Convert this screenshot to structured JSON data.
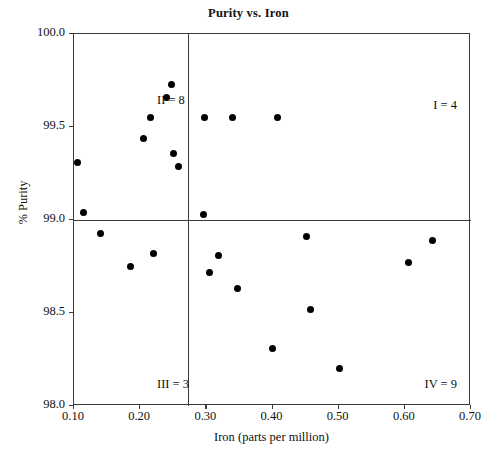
{
  "chart_data": {
    "type": "scatter",
    "title": "Purity vs. Iron",
    "xlabel": "Iron (parts per million)",
    "ylabel": "% Purity",
    "xlim": [
      0.1,
      0.7
    ],
    "ylim": [
      98.0,
      100.0
    ],
    "xticks": [
      "0.10",
      "0.20",
      "0.30",
      "0.40",
      "0.50",
      "0.60",
      "0.70"
    ],
    "xtick_values": [
      0.1,
      0.2,
      0.3,
      0.4,
      0.5,
      0.6,
      0.7
    ],
    "yticks": [
      "100.0",
      "99.5",
      "99.0",
      "98.5",
      "98.0"
    ],
    "ytick_values": [
      100.0,
      99.5,
      99.0,
      98.5,
      98.0
    ],
    "grid": false,
    "legend": null,
    "marker": "filled-circle",
    "marker_color": "#000000",
    "frame_color": "#3a3a3a",
    "divider_x": 0.2725,
    "divider_y": 99.0,
    "points": [
      {
        "x": 0.105,
        "y": 99.31
      },
      {
        "x": 0.115,
        "y": 99.04
      },
      {
        "x": 0.14,
        "y": 98.93
      },
      {
        "x": 0.185,
        "y": 98.75
      },
      {
        "x": 0.205,
        "y": 99.44
      },
      {
        "x": 0.215,
        "y": 99.55
      },
      {
        "x": 0.22,
        "y": 98.82
      },
      {
        "x": 0.24,
        "y": 99.66
      },
      {
        "x": 0.248,
        "y": 99.73
      },
      {
        "x": 0.25,
        "y": 99.36
      },
      {
        "x": 0.258,
        "y": 99.29
      },
      {
        "x": 0.295,
        "y": 99.03
      },
      {
        "x": 0.297,
        "y": 99.55
      },
      {
        "x": 0.305,
        "y": 98.72
      },
      {
        "x": 0.318,
        "y": 98.81
      },
      {
        "x": 0.34,
        "y": 99.55
      },
      {
        "x": 0.347,
        "y": 98.63
      },
      {
        "x": 0.4,
        "y": 98.31
      },
      {
        "x": 0.408,
        "y": 99.55
      },
      {
        "x": 0.452,
        "y": 98.91
      },
      {
        "x": 0.458,
        "y": 98.52
      },
      {
        "x": 0.502,
        "y": 98.2
      },
      {
        "x": 0.605,
        "y": 98.77
      },
      {
        "x": 0.642,
        "y": 98.89
      }
    ],
    "annotations": [
      {
        "name": "quadrant-1",
        "text": "I = 4",
        "position": "top-right",
        "count": 4
      },
      {
        "name": "quadrant-2",
        "text": "II = 8",
        "position": "top-left",
        "count": 8
      },
      {
        "name": "quadrant-3",
        "text": "III = 3",
        "position": "bottom-left",
        "count": 3
      },
      {
        "name": "quadrant-4",
        "text": "IV = 9",
        "position": "bottom-right",
        "count": 9
      }
    ]
  }
}
